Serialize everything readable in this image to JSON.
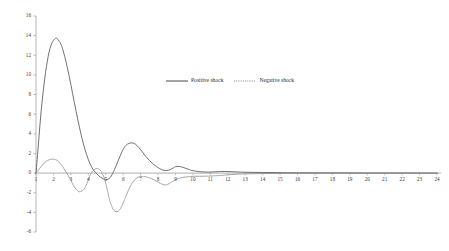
{
  "chart_data": {
    "type": "line",
    "title": "",
    "subtitle": "",
    "xlabel": "",
    "ylabel": "",
    "xlim": [
      1,
      24
    ],
    "ylim": [
      -6,
      16
    ],
    "grid": false,
    "legend_position": "top-center",
    "x": [
      1,
      2,
      3,
      4,
      5,
      6,
      7,
      8,
      9,
      10,
      11,
      12,
      13,
      14,
      15,
      16,
      17,
      18,
      19,
      20,
      21,
      22,
      23,
      24
    ],
    "xticks": [
      "1",
      "2",
      "3",
      "4",
      "5",
      "6",
      "7",
      "8",
      "9",
      "10",
      "11",
      "12",
      "13",
      "14",
      "15",
      "16",
      "17",
      "18",
      "19",
      "20",
      "21",
      "22",
      "23",
      "24"
    ],
    "yticks": [
      "16",
      "14",
      "12",
      "10",
      "8",
      "6",
      "4",
      "2",
      "0",
      "-2",
      "-4",
      "-6"
    ],
    "ytick_values": [
      16,
      14,
      12,
      10,
      8,
      6,
      4,
      2,
      0,
      -2,
      -4,
      -6
    ],
    "series": [
      {
        "name": "Positive shock",
        "style": "solid",
        "color": "#595959",
        "values": [
          0.0,
          13.4,
          8.4,
          0.4,
          -0.65,
          2.9,
          1.05,
          0.2,
          0.68,
          0.18,
          0.12,
          0.16,
          0.08,
          0.05,
          0.04,
          0.03,
          0.02,
          0.02,
          0.01,
          0.01,
          0.01,
          0.0,
          0.0,
          0.0
        ],
        "dense_x": [
          1.0,
          1.15,
          1.3,
          1.5,
          1.7,
          1.9,
          2.1,
          2.2,
          2.35,
          2.5,
          2.7,
          2.9,
          3.1,
          3.3,
          3.5,
          3.7,
          3.9,
          4.1,
          4.3,
          4.5,
          4.7,
          4.9,
          5.0,
          5.15,
          5.3,
          5.5,
          5.7,
          5.9,
          6.1,
          6.3,
          6.5,
          6.7,
          6.9,
          7.1,
          7.3,
          7.5,
          7.7,
          7.9,
          8.1,
          8.3,
          8.5,
          8.7,
          8.9,
          9.0,
          9.2,
          9.4,
          9.6,
          9.8,
          10.0,
          10.4,
          10.8,
          11.2,
          11.6,
          12.0,
          12.5,
          13.0,
          14.0,
          15.0,
          16.0,
          18.0,
          20.0,
          22.0,
          24.0
        ],
        "dense_y": [
          0.0,
          3.2,
          6.4,
          9.6,
          11.9,
          13.2,
          13.7,
          13.7,
          13.4,
          12.8,
          11.5,
          9.9,
          8.1,
          6.3,
          4.6,
          3.1,
          1.9,
          0.95,
          0.3,
          -0.1,
          -0.42,
          -0.62,
          -0.68,
          -0.6,
          -0.35,
          0.35,
          1.2,
          2.05,
          2.7,
          3.0,
          3.08,
          2.95,
          2.6,
          2.15,
          1.7,
          1.3,
          0.95,
          0.68,
          0.45,
          0.3,
          0.26,
          0.35,
          0.55,
          0.65,
          0.68,
          0.6,
          0.48,
          0.35,
          0.25,
          0.14,
          0.1,
          0.12,
          0.16,
          0.16,
          0.12,
          0.09,
          0.06,
          0.04,
          0.03,
          0.02,
          0.01,
          0.01,
          0.0
        ]
      },
      {
        "name": "Negative shock",
        "style": "dotted",
        "color": "#8a8a8a",
        "values": [
          0.0,
          1.4,
          -1.9,
          0.45,
          -3.9,
          -0.35,
          -0.55,
          -1.2,
          -0.5,
          -0.35,
          -0.3,
          -0.12,
          -0.06,
          -0.04,
          -0.03,
          -0.02,
          -0.02,
          -0.01,
          -0.01,
          0.0,
          0.0,
          0.0,
          0.0,
          0.0
        ],
        "dense_x": [
          1.0,
          1.2,
          1.4,
          1.6,
          1.8,
          2.0,
          2.15,
          2.3,
          2.5,
          2.7,
          2.9,
          3.0,
          3.15,
          3.3,
          3.5,
          3.7,
          3.85,
          4.0,
          4.15,
          4.3,
          4.5,
          4.7,
          4.9,
          5.1,
          5.2,
          5.35,
          5.5,
          5.7,
          5.9,
          6.1,
          6.3,
          6.5,
          6.7,
          6.9,
          7.0,
          7.2,
          7.4,
          7.6,
          7.8,
          8.0,
          8.2,
          8.35,
          8.5,
          8.7,
          8.9,
          9.1,
          9.3,
          9.5,
          9.8,
          10.1,
          10.5,
          11.0,
          11.5,
          12.0,
          12.5,
          13.0,
          14.0,
          15.0,
          16.0,
          18.0,
          20.0,
          22.0,
          24.0
        ],
        "dense_y": [
          0.0,
          0.45,
          0.9,
          1.22,
          1.38,
          1.42,
          1.35,
          1.15,
          0.72,
          0.18,
          -0.42,
          -0.75,
          -1.25,
          -1.65,
          -1.9,
          -1.72,
          -1.35,
          -0.7,
          -0.05,
          0.3,
          0.47,
          0.25,
          -0.45,
          -1.8,
          -2.6,
          -3.4,
          -3.85,
          -3.9,
          -3.45,
          -2.6,
          -1.75,
          -1.05,
          -0.62,
          -0.38,
          -0.34,
          -0.35,
          -0.42,
          -0.55,
          -0.72,
          -0.92,
          -1.1,
          -1.2,
          -1.18,
          -1.0,
          -0.78,
          -0.6,
          -0.48,
          -0.42,
          -0.36,
          -0.33,
          -0.32,
          -0.3,
          -0.25,
          -0.18,
          -0.12,
          -0.08,
          -0.05,
          -0.035,
          -0.025,
          -0.015,
          -0.01,
          -0.005,
          0.0
        ]
      }
    ]
  },
  "legend": {
    "entries": [
      {
        "label": "Positive shock"
      },
      {
        "label": "Negative shock"
      }
    ]
  },
  "axes": {
    "axis_color": "#9a9a9a",
    "zero_line_color": "#9a9a9a"
  }
}
